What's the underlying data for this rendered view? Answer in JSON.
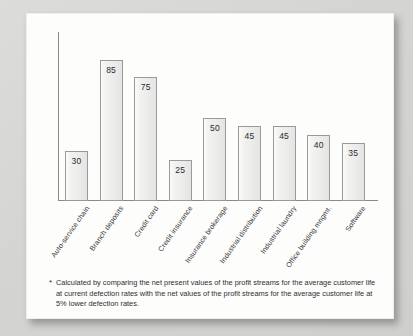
{
  "chart_data": {
    "type": "bar",
    "title": "",
    "subtitle": "",
    "xlabel": "",
    "ylabel": "",
    "ylim": [
      0,
      100
    ],
    "grid": false,
    "legend": "none",
    "value_label_position": "inside-top",
    "categories": [
      "Auto-service chain",
      "Branch deposits",
      "Credit card",
      "Credit insurance",
      "Insurance brokerage",
      "Industrial distribution",
      "Industrial laundry",
      "Office building mngmt.",
      "Software"
    ],
    "values": [
      30,
      85,
      75,
      25,
      50,
      45,
      45,
      40,
      35
    ],
    "bar_fill": "#eeeeed",
    "bar_stroke": "#9a9a9a",
    "axis_color": "#8a8a8a"
  },
  "footnote": {
    "marker": "*",
    "text": "Calculated by comparing the net present values of the profit streams for the average customer life at current defection rates with the net values of the profit streams for the average customer life at 5% lower defection rates."
  }
}
